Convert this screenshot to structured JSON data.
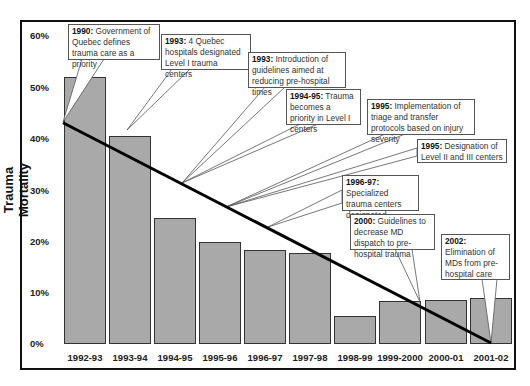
{
  "chart_data": {
    "type": "bar",
    "title": "",
    "xlabel": "",
    "ylabel": "Trauma Mortality",
    "ylim": [
      0,
      60
    ],
    "y_ticks": [
      "0%",
      "10%",
      "20%",
      "30%",
      "40%",
      "50%",
      "60%"
    ],
    "grid": false,
    "legend": null,
    "categories": [
      "1992-93",
      "1993-94",
      "1994-95",
      "1995-96",
      "1996-97",
      "1997-98",
      "1998-99",
      "1999-2000",
      "2000-01",
      "2001-02"
    ],
    "values": [
      51.8,
      40.3,
      24.4,
      19.7,
      18.2,
      17.6,
      5.2,
      8.1,
      8.3,
      8.7
    ],
    "trendline": {
      "type": "linear",
      "start": {
        "category": "1992-93",
        "value": 42.9
      },
      "end": {
        "category": "2001-02",
        "value": 0.0
      }
    },
    "annotations": [
      {
        "year": "1990:",
        "text": " Government of Quebec defines trauma care as a priority"
      },
      {
        "year": "1993:",
        "text": " 4 Quebec hospitals designated Level I trauma centers"
      },
      {
        "year": "1993:",
        "text": " Introduction of guidelines aimed at reducing pre-hospital times"
      },
      {
        "year": "1994-95:",
        "text": " Trauma becomes a priority in Level I centers"
      },
      {
        "year": "1995:",
        "text": " Implementation of triage and transfer protocols based on injury severity"
      },
      {
        "year": "1995:",
        "text": " Designation of Level II and III centers"
      },
      {
        "year": "1996-97:",
        "text": " Specialized trauma centers designated"
      },
      {
        "year": "2000:",
        "text": " Guidelines to decrease MD dispatch to pre-hospital trauma"
      },
      {
        "year": "2002:",
        "text": " Elimination of MDs from pre-hospital care"
      }
    ]
  },
  "colors": {
    "bar_fill": "#a9a9a9",
    "bar_border": "#333333",
    "trendline": "#000000",
    "frame": "#111111"
  }
}
